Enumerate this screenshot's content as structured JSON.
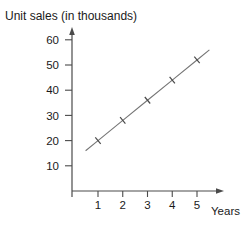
{
  "chart_data": {
    "type": "line",
    "title": "Unit sales (in thousands)",
    "xlabel": "Years",
    "ylabel": "Unit sales (in thousands)",
    "x": [
      1,
      2,
      3,
      4,
      5
    ],
    "values": [
      20,
      28,
      36,
      44,
      52
    ],
    "series": [
      {
        "name": "Unit sales",
        "values": [
          20,
          28,
          36,
          44,
          52
        ]
      }
    ],
    "x_ticks": [
      1,
      2,
      3,
      4,
      5
    ],
    "y_ticks": [
      10,
      20,
      30,
      40,
      50,
      60
    ],
    "ylim": [
      0,
      60
    ],
    "xlim": [
      0,
      5.8
    ],
    "grid": false,
    "legend_position": "none",
    "marker": "x",
    "line_extent_years": [
      0.5,
      5.5
    ],
    "colors": {
      "axis": "#4a4a4a",
      "line": "#757575",
      "marker": "#4a4a4a",
      "text": "#1a1a1a",
      "background": "#ffffff"
    }
  }
}
